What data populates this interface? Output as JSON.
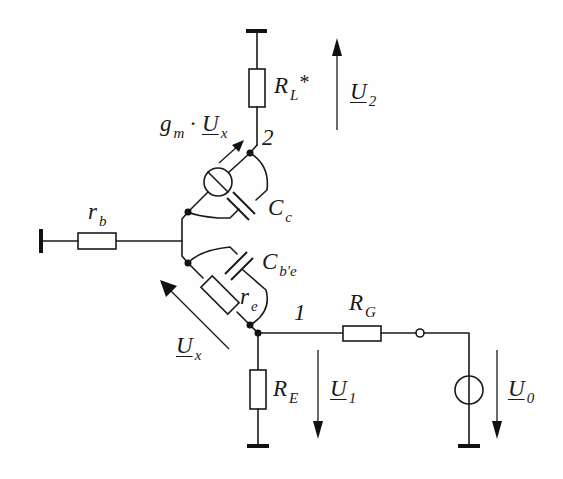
{
  "diagram": {
    "type": "small-signal equivalent circuit (common-base transistor stage)",
    "colors": {
      "line": "#1a1a1a",
      "background": "#fefefe"
    },
    "components": [
      {
        "id": "RL",
        "kind": "resistor",
        "label_main": "R",
        "label_sub": "L",
        "label_suffix": "*"
      },
      {
        "id": "gm",
        "kind": "controlled-current-source",
        "label_main": "g",
        "label_sub": "m",
        "label_op": "·",
        "label_var": "U",
        "label_var_sub": "x"
      },
      {
        "id": "Cc",
        "kind": "capacitor",
        "label_main": "C",
        "label_sub": "c"
      },
      {
        "id": "rb",
        "kind": "resistor",
        "label_main": "r",
        "label_sub": "b"
      },
      {
        "id": "Cbe",
        "kind": "capacitor",
        "label_main": "C",
        "label_sub": "b'e"
      },
      {
        "id": "re",
        "kind": "resistor",
        "label_main": "r",
        "label_sub": "e"
      },
      {
        "id": "RG",
        "kind": "resistor",
        "label_main": "R",
        "label_sub": "G"
      },
      {
        "id": "RE",
        "kind": "resistor",
        "label_main": "R",
        "label_sub": "E"
      },
      {
        "id": "U0src",
        "kind": "voltage-source"
      }
    ],
    "nodes": [
      {
        "id": "n1",
        "label": "1"
      },
      {
        "id": "n2",
        "label": "2"
      }
    ],
    "voltages": [
      {
        "id": "U2",
        "label_main": "U",
        "label_sub": "2",
        "direction": "up"
      },
      {
        "id": "Ux",
        "label_main": "U",
        "label_sub": "x",
        "direction": "up-left"
      },
      {
        "id": "U1",
        "label_main": "U",
        "label_sub": "1",
        "direction": "down"
      },
      {
        "id": "U0",
        "label_main": "U",
        "label_sub": "0",
        "direction": "down"
      }
    ]
  }
}
